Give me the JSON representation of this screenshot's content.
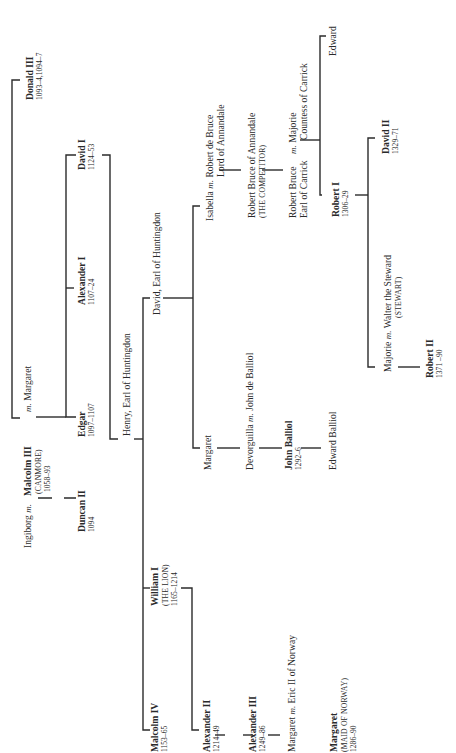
{
  "diagram": {
    "type": "genealogical-tree",
    "orientation": "rotated-90-ccw",
    "colors": {
      "background": "#ffffff",
      "ink": "#2b2b2b"
    }
  },
  "persons": {
    "donald3": {
      "name": "Donald III",
      "dates": "1093–4,1094–7",
      "king": true
    },
    "ingiborg": {
      "name": "Ingiborg",
      "m": "m."
    },
    "malcolm3": {
      "name": "Malcolm III",
      "epithet": "(CANMORE)",
      "dates": "1058–93",
      "king": true,
      "m": "m.",
      "spouse": "Margaret"
    },
    "duncan2": {
      "name": "Duncan II",
      "dates": "1094",
      "king": true
    },
    "edgar": {
      "name": "Edgar",
      "dates": "1097–1107",
      "king": true
    },
    "alexander1": {
      "name": "Alexander I",
      "dates": "1107–24",
      "king": true
    },
    "david1": {
      "name": "David I",
      "dates": "1124–53",
      "king": true
    },
    "henry": {
      "name": "Henry, Earl of Huntingdon"
    },
    "malcolm4": {
      "name": "Malcolm IV",
      "dates": "1153–65",
      "king": true
    },
    "william1": {
      "name": "William I",
      "epithet": "(THE LION)",
      "dates": "1165–1214",
      "king": true
    },
    "davidEarl": {
      "name": "David, Earl of Huntingdon"
    },
    "alexander2": {
      "name": "Alexander II",
      "dates": "1214–49",
      "king": true
    },
    "alexander3": {
      "name": "Alexander III",
      "dates": "1249–86",
      "king": true
    },
    "margaretNorway": {
      "name": "Margaret",
      "m": "m.",
      "spouse": "Eric II of Norway"
    },
    "maid": {
      "name": "Margaret",
      "epithet": "(MAID OF NORWAY)",
      "dates": "1286–90",
      "king": true
    },
    "margaretH": {
      "name": "Margaret"
    },
    "devorguilla": {
      "name": "Devorguilla",
      "m": "m.",
      "spouse": "John de Balliol"
    },
    "johnBalliol": {
      "name": "John Balliol",
      "dates": "1292–6",
      "king": true
    },
    "edwardBalliol": {
      "name": "Edward Balliol"
    },
    "isabella": {
      "name": "Isabella",
      "m": "m.",
      "spouse": "Robert de Bruce",
      "spouse_title": "Lord of Annandale"
    },
    "competitor": {
      "name": "Robert Bruce of Annandale",
      "epithet": "(THE COMPETITOR)"
    },
    "carrick": {
      "name": "Robert Bruce",
      "title": "Earl of Carrick",
      "m": "m.",
      "spouse": "Majorie",
      "spouse_title": "Countess of Carrick"
    },
    "edward": {
      "name": "Edward"
    },
    "robert1": {
      "name": "Robert I",
      "dates": "1306–29",
      "king": true
    },
    "david2": {
      "name": "David II",
      "dates": "1329–71",
      "king": true
    },
    "majorie": {
      "name": "Majorie",
      "m": "m.",
      "spouse": "Walter the Steward",
      "spouse_epithet": "(STEWART)"
    },
    "robert2": {
      "name": "Robert II",
      "dates": "1371 –90",
      "king": true
    }
  },
  "relations": [
    {
      "parent": "malcolm3",
      "children": [
        "duncan2"
      ],
      "mother": "ingiborg"
    },
    {
      "parent": "malcolm3",
      "children": [
        "edgar",
        "alexander1",
        "david1"
      ],
      "mother": "Margaret"
    },
    {
      "sibling_of": "malcolm3",
      "person": "donald3"
    },
    {
      "parent": "david1",
      "children": [
        "henry"
      ]
    },
    {
      "parent": "henry",
      "children": [
        "malcolm4",
        "william1",
        "davidEarl"
      ]
    },
    {
      "parent": "william1",
      "children": [
        "alexander2"
      ]
    },
    {
      "parent": "alexander2",
      "children": [
        "alexander3"
      ]
    },
    {
      "parent": "alexander3",
      "children": [
        "margaretNorway"
      ]
    },
    {
      "parent": "margaretNorway",
      "children": [
        "maid"
      ]
    },
    {
      "parent": "davidEarl",
      "children": [
        "margaretH",
        "isabella"
      ]
    },
    {
      "parent": "margaretH",
      "children": [
        "devorguilla"
      ]
    },
    {
      "parent": "devorguilla",
      "children": [
        "johnBalliol"
      ]
    },
    {
      "parent": "johnBalliol",
      "children": [
        "edwardBalliol"
      ]
    },
    {
      "parent": "isabella",
      "children": [
        "competitor"
      ]
    },
    {
      "parent": "competitor",
      "children": [
        "carrick"
      ]
    },
    {
      "parent": "carrick",
      "children": [
        "robert1",
        "edward"
      ]
    },
    {
      "parent": "robert1",
      "children": [
        "majorie",
        "david2"
      ]
    },
    {
      "parent": "majorie",
      "children": [
        "robert2"
      ]
    }
  ]
}
